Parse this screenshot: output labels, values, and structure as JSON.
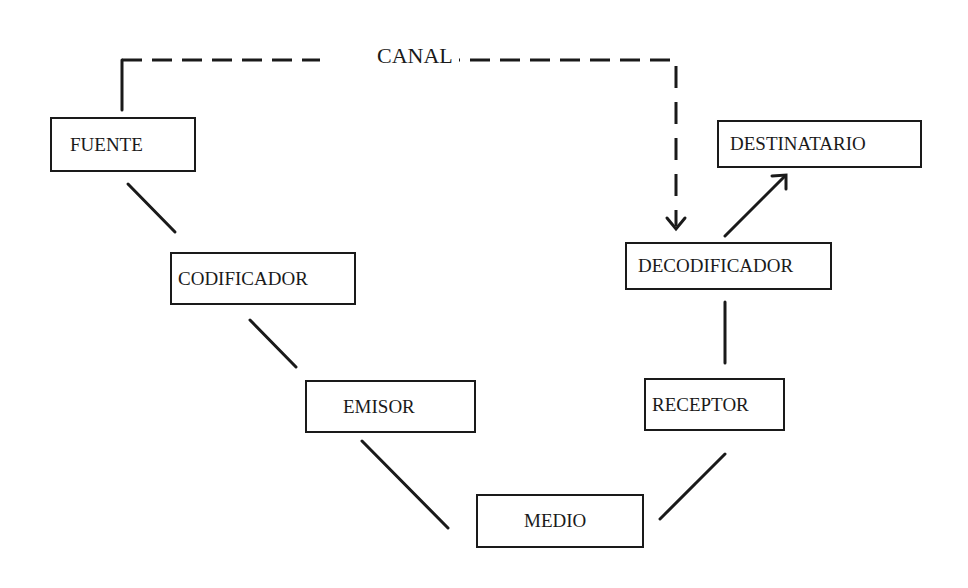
{
  "diagram": {
    "channel_label": "CANAL",
    "nodes": [
      {
        "id": "fuente",
        "label": "FUENTE"
      },
      {
        "id": "codificador",
        "label": "CODIFICADOR"
      },
      {
        "id": "emisor",
        "label": "EMISOR"
      },
      {
        "id": "medio",
        "label": "MEDIO"
      },
      {
        "id": "receptor",
        "label": "RECEPTOR"
      },
      {
        "id": "decodificador",
        "label": "DECODIFICADOR"
      },
      {
        "id": "destinatario",
        "label": "DESTINATARIO"
      }
    ],
    "edges": [
      {
        "from": "fuente",
        "to": "codificador",
        "style": "solid"
      },
      {
        "from": "codificador",
        "to": "emisor",
        "style": "solid"
      },
      {
        "from": "emisor",
        "to": "medio",
        "style": "solid"
      },
      {
        "from": "medio",
        "to": "receptor",
        "style": "solid"
      },
      {
        "from": "receptor",
        "to": "decodificador",
        "style": "solid"
      },
      {
        "from": "decodificador",
        "to": "destinatario",
        "style": "solid-arrow"
      },
      {
        "from": "fuente",
        "to": "decodificador",
        "style": "dashed-arrow",
        "label": "CANAL"
      }
    ]
  }
}
